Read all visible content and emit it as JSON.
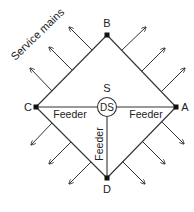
{
  "diagram": {
    "title_label": "Service mains",
    "substation": {
      "top_label": "S",
      "inner_label": "DS"
    },
    "nodes": {
      "a": "A",
      "b": "B",
      "c": "C",
      "d": "D"
    },
    "feeders": {
      "left": "Feeder",
      "right": "Feeder",
      "down": "Feeder"
    },
    "colors": {
      "line": "#333333",
      "text": "#222222",
      "background": "#ffffff"
    }
  }
}
